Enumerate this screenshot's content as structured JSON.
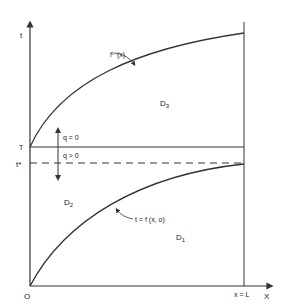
{
  "diagram": {
    "axes": {
      "y_label": "t",
      "x_label": "X",
      "origin_label": "O",
      "x_end_label": "x = L"
    },
    "levels": {
      "T_label": "T",
      "tstar_label": "t*"
    },
    "curves": {
      "upper_label": "f⁰ (x)",
      "lower_label": "t = f (x, o)"
    },
    "regions": {
      "D1": {
        "main": "D",
        "sub": "1"
      },
      "D2": {
        "main": "D",
        "sub": "2"
      },
      "D3": {
        "main": "D",
        "sub": "3"
      }
    },
    "flux": {
      "upper": "q = 0",
      "lower": "q > 0"
    },
    "colors": {
      "line": "#333333",
      "background": "#ffffff"
    }
  }
}
